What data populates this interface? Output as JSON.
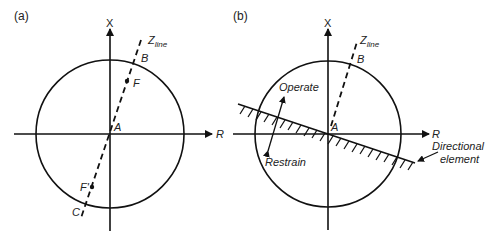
{
  "panels": [
    {
      "id": "a",
      "label": "(a)",
      "axes": {
        "x_label": "X",
        "r_label": "R"
      },
      "zline_label": {
        "main": "Z",
        "sub": "line"
      },
      "points": {
        "A": "A",
        "B": "B",
        "C": "C",
        "F": "F",
        "F_prime": "F'"
      }
    },
    {
      "id": "b",
      "label": "(b)",
      "axes": {
        "x_label": "X",
        "r_label": "R"
      },
      "zline_label": {
        "main": "Z",
        "sub": "line"
      },
      "points": {
        "A": "A",
        "B": "B"
      },
      "operate_label": "Operate",
      "restrain_label": "Restrain",
      "directional_label_line1": "Directional",
      "directional_label_line2": "element"
    }
  ],
  "colors": {
    "stroke": "#111111",
    "text": "#222222"
  }
}
